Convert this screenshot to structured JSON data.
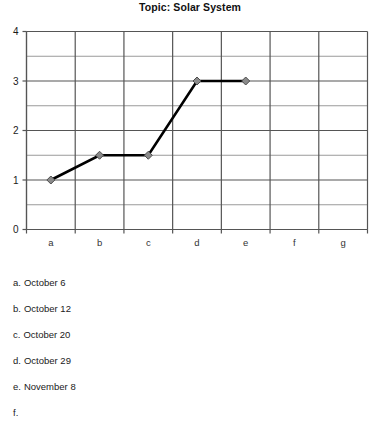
{
  "chart_data": {
    "type": "line",
    "title": "Topic: Solar System",
    "xlabel": "",
    "ylabel": "",
    "categories": [
      "a",
      "b",
      "c",
      "d",
      "e",
      "f",
      "g"
    ],
    "series": [
      {
        "name": "series-1",
        "values": [
          1,
          1.5,
          1.5,
          3,
          3,
          null,
          null
        ]
      }
    ],
    "ylim": [
      0,
      4
    ],
    "yticks": [
      0,
      1,
      2,
      3,
      4
    ],
    "ytick_labels": [
      "0",
      "1",
      "2",
      "3",
      "4"
    ],
    "minor_yticks": [
      0.5,
      1.5,
      2.5,
      3.5
    ],
    "grid": true,
    "legend_position": "below-chart",
    "marker": "diamond",
    "marker_color": "#8a8a8a",
    "line_color": "#000000",
    "major_grid_color": "#555555",
    "minor_grid_color": "#9a9a9a"
  },
  "legend": {
    "items": [
      {
        "key": "a.",
        "value": "October 6"
      },
      {
        "key": "b.",
        "value": "October 12"
      },
      {
        "key": "c.",
        "value": "October 20"
      },
      {
        "key": "d.",
        "value": "October 29"
      },
      {
        "key": "e.",
        "value": "November 8"
      },
      {
        "key": "f.",
        "value": ""
      }
    ]
  }
}
